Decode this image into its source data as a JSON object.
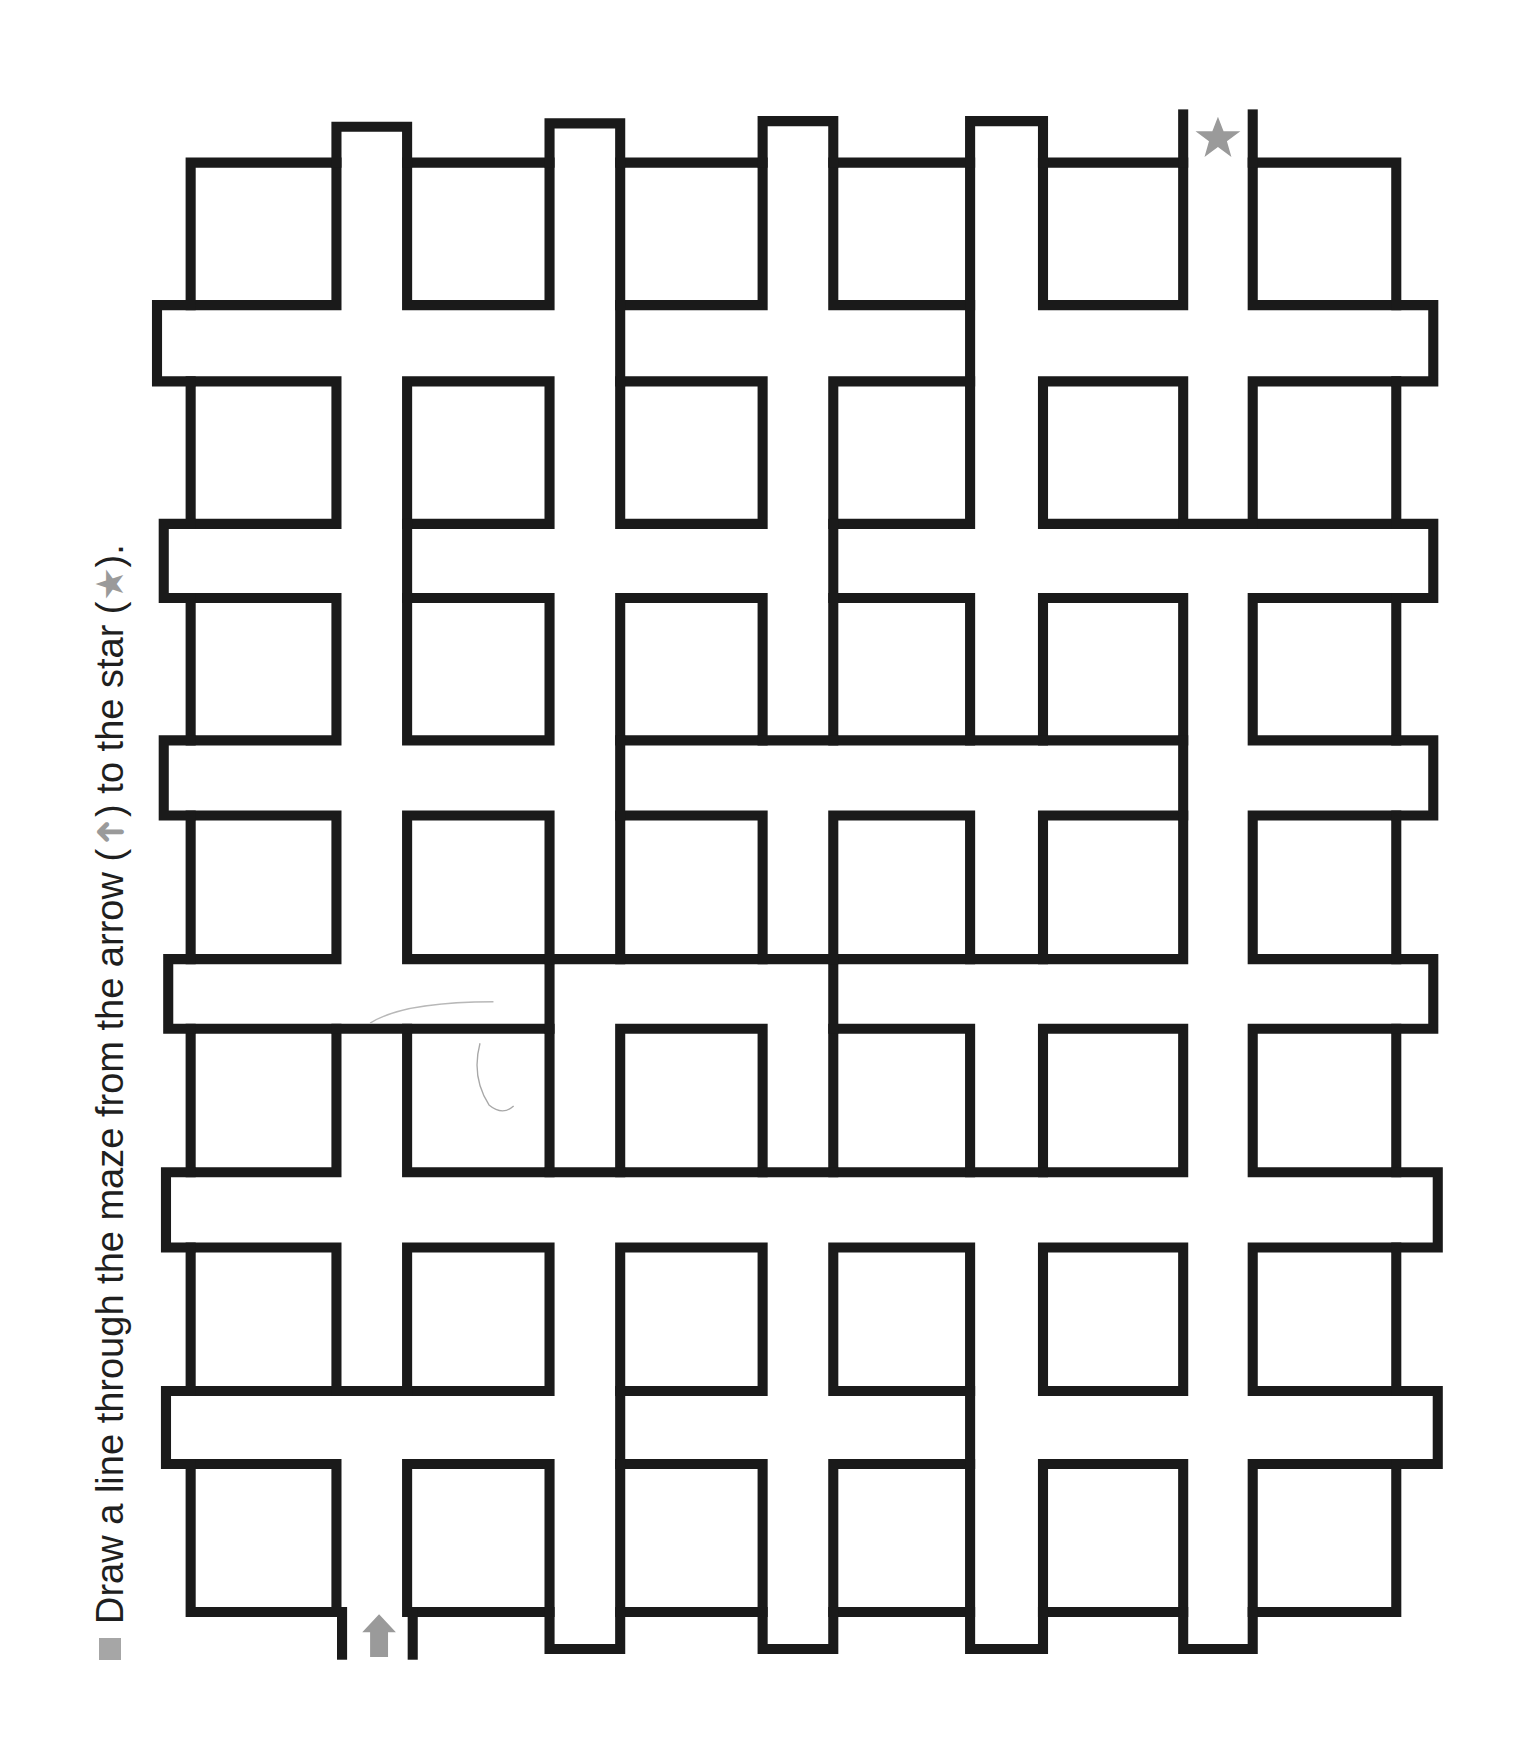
{
  "instruction": {
    "prefix": "Draw a line through the maze from the arrow (",
    "arrow_glyph": "➜",
    "middle": ") to the star (",
    "star_glyph": "★",
    "suffix": ")."
  },
  "maze": {
    "start_marker": "arrow-up",
    "end_marker": "star",
    "marker_color": "#9a9a9a",
    "wall_color": "#1a1a1a",
    "columns": 6,
    "rows": 7,
    "col_x": [
      [
        170,
        300
      ],
      [
        363,
        490
      ],
      [
        553,
        680
      ],
      [
        743,
        865
      ],
      [
        930,
        1055
      ],
      [
        1117,
        1245
      ]
    ],
    "row_y": [
      [
        145,
        272
      ],
      [
        340,
        467
      ],
      [
        533,
        660
      ],
      [
        727,
        855
      ],
      [
        917,
        1045
      ],
      [
        1112,
        1240
      ],
      [
        1305,
        1437
      ]
    ]
  }
}
